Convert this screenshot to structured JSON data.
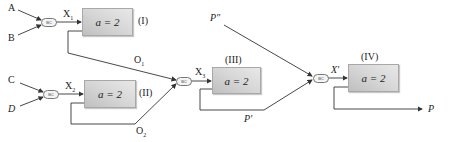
{
  "diagram": {
    "inputs": {
      "a": "A",
      "b": "B",
      "c": "C",
      "d": "D",
      "p_double_prime": "P″"
    },
    "combiner_label": "BC",
    "blocks": [
      {
        "id": "I",
        "label": "(I)",
        "param": "a = 2"
      },
      {
        "id": "II",
        "label": "(II)",
        "param": "a = 2"
      },
      {
        "id": "III",
        "label": "(III)",
        "param": "a = 2"
      },
      {
        "id": "IV",
        "label": "(IV)",
        "param": "a = 2"
      }
    ],
    "signals": {
      "x1": "X",
      "x1_sub": "1",
      "x2": "X",
      "x2_sub": "2",
      "x3": "X",
      "x3_sub": "3",
      "x_prime": "X′",
      "o1": "O",
      "o1_sub": "1",
      "o2": "O",
      "o2_sub": "2",
      "p_prime": "P′",
      "p": "P"
    },
    "colors": {
      "line": "#333333",
      "box_border": "#a8a8a8",
      "box_fill": "#d6d6d6"
    }
  }
}
